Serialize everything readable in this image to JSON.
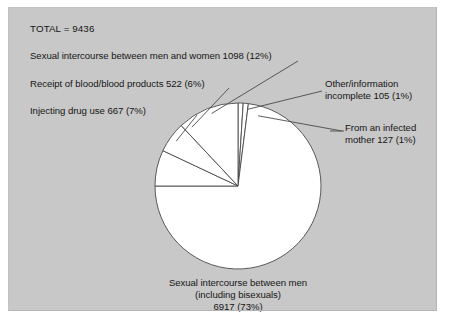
{
  "figure": {
    "background_color": "#c8c8c8",
    "page_color": "#ffffff",
    "slice_fill": "#ffffff",
    "slice_stroke": "#4a4a4a",
    "text_color": "#161616"
  },
  "total_label": "TOTAL = 9436",
  "labels": {
    "heterosexual": "Sexual intercourse between men and women 1098 (12%)",
    "blood": "Receipt of blood/blood products 522 (6%)",
    "injecting": "Injecting drug use 667 (7%)",
    "other": "Other/information\nincomplete 105 (1%)",
    "mother": "From an infected\nmother 127 (1%)",
    "msm": "Sexual intercourse between men\n(including bisexuals)\n6917 (73%)"
  },
  "chart_data": {
    "type": "pie",
    "title": "",
    "subtitle": "",
    "total": 9436,
    "total_label": "TOTAL = 9436",
    "grid": false,
    "legend_position": "callout-labels",
    "categories": [
      "Sexual intercourse between men (including bisexuals)",
      "Sexual intercourse between men and women",
      "Injecting drug use",
      "Receipt of blood/blood products",
      "From an infected mother",
      "Other/information incomplete"
    ],
    "values": [
      6917,
      1098,
      667,
      522,
      127,
      105
    ],
    "percentages": [
      73,
      12,
      7,
      6,
      1,
      1
    ],
    "slices": [
      {
        "label": "Sexual intercourse between men (including bisexuals)",
        "value": 6917,
        "percent": 73,
        "value_text": "6917 (73%)",
        "callout": "Sexual intercourse between men\n(including bisexuals)\n6917 (73%)",
        "callout_position": "bottom"
      },
      {
        "label": "Sexual intercourse between men and women",
        "value": 1098,
        "percent": 12,
        "value_text": "1098 (12%)",
        "callout": "Sexual intercourse between men and women 1098 (12%)",
        "callout_position": "top-left"
      },
      {
        "label": "Injecting drug use",
        "value": 667,
        "percent": 7,
        "value_text": "667 (7%)",
        "callout": "Injecting drug use 667 (7%)",
        "callout_position": "left"
      },
      {
        "label": "Receipt of blood/blood products",
        "value": 522,
        "percent": 6,
        "value_text": "522 (6%)",
        "callout": "Receipt of blood/blood products 522 (6%)",
        "callout_position": "left"
      },
      {
        "label": "From an infected mother",
        "value": 127,
        "percent": 1,
        "value_text": "127 (1%)",
        "callout": "From an infected\nmother 127 (1%)",
        "callout_position": "right"
      },
      {
        "label": "Other/information incomplete",
        "value": 105,
        "percent": 1,
        "value_text": "105 (1%)",
        "callout": "Other/information\nincomplete 105 (1%)",
        "callout_position": "top-right"
      }
    ],
    "geometry": {
      "center_x": 230,
      "center_y": 179,
      "radius": 83,
      "start_angle_deg": 0,
      "direction": "counterclockwise-from-top"
    }
  }
}
